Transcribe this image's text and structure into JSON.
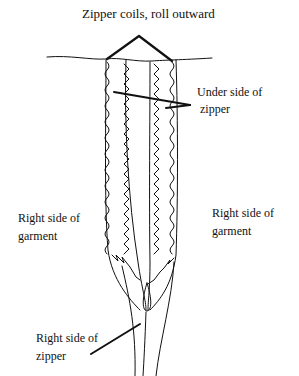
{
  "labels": {
    "top": "Zipper coils, roll outward",
    "underside_line1": "Under side of",
    "underside_line2": "zipper",
    "left_garment_line1": "Right side of",
    "left_garment_line2": "garment",
    "right_garment_line1": "Right side of",
    "right_garment_line2": "garment",
    "zipper_line1": "Right side of",
    "zipper_line2": "zipper"
  },
  "colors": {
    "ink": "#111111",
    "background": "#ffffff"
  }
}
